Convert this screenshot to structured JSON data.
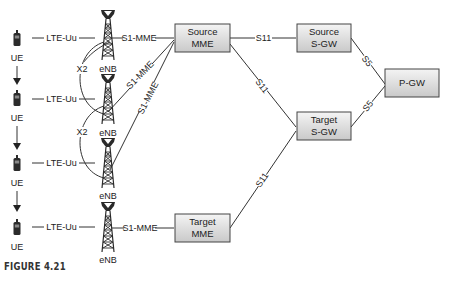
{
  "diagram": {
    "ue_nodes": [
      {
        "label": "UE",
        "radio_link": "LTE-Uu"
      },
      {
        "label": "UE",
        "radio_link": "LTE-Uu"
      },
      {
        "label": "UE",
        "radio_link": "LTE-Uu"
      },
      {
        "label": "UE",
        "radio_link": "LTE-Uu"
      }
    ],
    "enb_nodes": [
      {
        "label": "eNB"
      },
      {
        "label": "eNB"
      },
      {
        "label": "eNB"
      },
      {
        "label": "eNB"
      }
    ],
    "x2_links": [
      {
        "label": "X2",
        "between": [
          "eNB 1",
          "eNB 2"
        ]
      },
      {
        "label": "X2",
        "between": [
          "eNB 2",
          "eNB 3"
        ]
      }
    ],
    "s1_links": [
      {
        "label": "S1-MME",
        "from": "eNB 1",
        "to": "Source MME"
      },
      {
        "label": "S1-MME",
        "from": "eNB 2",
        "to": "Source MME"
      },
      {
        "label": "S1-MME",
        "from": "eNB 3",
        "to": "Source MME"
      },
      {
        "label": "S1-MME",
        "from": "eNB 4",
        "to": "Target MME"
      }
    ],
    "boxes": {
      "source_mme": {
        "line1": "Source",
        "line2": "MME"
      },
      "target_mme": {
        "line1": "Target",
        "line2": "MME"
      },
      "source_sgw": {
        "line1": "Source",
        "line2": "S-GW"
      },
      "target_sgw": {
        "line1": "Target",
        "line2": "S-GW"
      },
      "pgw": {
        "line1": "P-GW"
      }
    },
    "core_links": {
      "source_mme_to_source_sgw": "S11",
      "source_mme_to_target_sgw": "S11",
      "target_mme_to_target_sgw": "S11",
      "source_sgw_to_pgw": "S5",
      "target_sgw_to_pgw": "S5"
    },
    "caption": "FIGURE 4.21"
  }
}
